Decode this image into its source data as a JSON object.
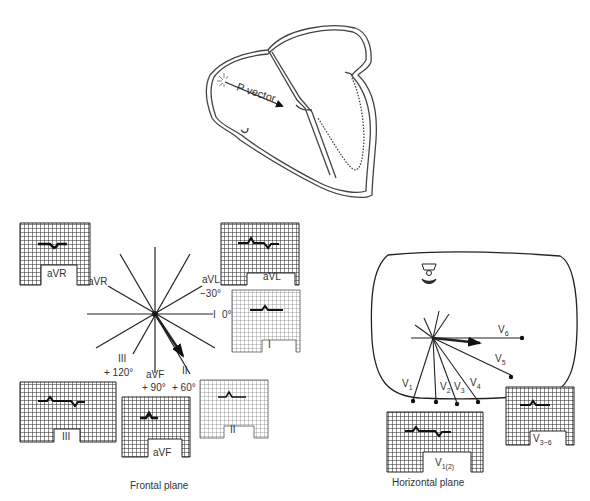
{
  "heart": {
    "vector_label": "P vector"
  },
  "frontal": {
    "caption": "Frontal plane",
    "axis_labels": {
      "aVR": "aVR",
      "aVL": "aVL",
      "aVL_deg": "−30°",
      "I": "I",
      "I_deg": "0°",
      "III": "III",
      "III_deg": "+ 120°",
      "aVF": "aVF",
      "aVF_deg": "+ 90°",
      "II": "II",
      "II_deg": "+ 60°"
    },
    "strips": {
      "aVR": "aVR",
      "aVL": "aVL",
      "I": "I",
      "III": "III",
      "aVF": "aVF",
      "II": "II"
    }
  },
  "horizontal": {
    "caption": "Horizontal plane",
    "leads": {
      "V1": "V",
      "V1_sub": "1",
      "V2": "V",
      "V2_sub": "2",
      "V3": "V",
      "V3_sub": "3",
      "V4": "V",
      "V4_sub": "4",
      "V5": "V",
      "V5_sub": "5",
      "V6": "V",
      "V6_sub": "6"
    },
    "strips": {
      "V12": "V",
      "V12_sub": "1(2)",
      "V36": "V",
      "V36_sub": "3−6"
    }
  }
}
